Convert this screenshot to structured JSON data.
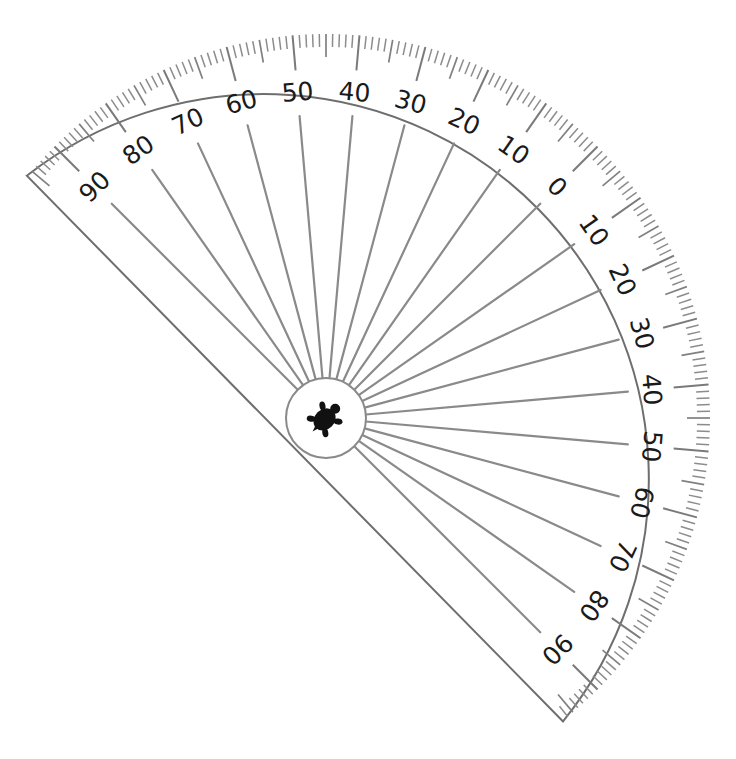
{
  "figure": {
    "center": [
      326,
      418
    ],
    "outer_radius": 385,
    "hub_radius": 40,
    "zero_direction_deg": -45,
    "arc_start_deg": -141,
    "arc_end_deg": 52,
    "colors": {
      "outline": "#6e6e6e",
      "rays": "#8a8a8a",
      "labels": "#1a1a1a",
      "turtle": "#111111",
      "background": "#ffffff"
    }
  },
  "scale": {
    "left_side_labels": [
      "90",
      "80",
      "70",
      "60",
      "50",
      "40",
      "30",
      "20",
      "10"
    ],
    "zero_label": "0",
    "right_side_labels": [
      "10",
      "20",
      "30",
      "40",
      "50",
      "60",
      "70",
      "80",
      "90"
    ],
    "minor_tick_step_deg": 1,
    "medium_tick_step_deg": 5,
    "major_tick_step_deg": 10
  },
  "hub": {
    "icon": "turtle-icon"
  }
}
